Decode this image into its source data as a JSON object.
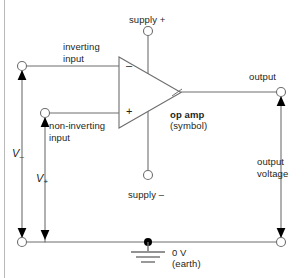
{
  "diagram": {
    "colors": {
      "wire": "#6e6e6e",
      "ink": "#231f20",
      "arrow": "#000000",
      "terminal_fill": "#ffffff",
      "border": "#b9b9b9"
    }
  },
  "labels": {
    "supply_plus": "supply +",
    "supply_minus": "supply –",
    "inverting_input": "inverting\ninput",
    "non_inverting_input": "non-inverting\ninput",
    "output": "output",
    "output_voltage": "output\nvoltage",
    "op_amp_bold": "op amp",
    "op_amp_sub": "(symbol)",
    "ground_line1": "0 V",
    "ground_line2": "(earth)",
    "v_minus_sym": "V",
    "v_minus_sub": "–",
    "v_plus_sym": "V",
    "v_plus_sub": "+",
    "terminal_minus": "–",
    "terminal_plus": "+"
  },
  "nodes": {
    "supply_plus_terminal": {
      "x": 148,
      "y": 31
    },
    "supply_minus_terminal": {
      "x": 148,
      "y": 175
    },
    "inverting_terminal": {
      "x": 22,
      "y": 66
    },
    "non_inverting_terminal": {
      "x": 45,
      "y": 113
    },
    "output_terminal": {
      "x": 281,
      "y": 92
    },
    "ground_left_terminal": {
      "x": 22,
      "y": 242
    },
    "ground_right_terminal": {
      "x": 281,
      "y": 242
    },
    "earth_node": {
      "x": 148,
      "y": 242
    }
  }
}
